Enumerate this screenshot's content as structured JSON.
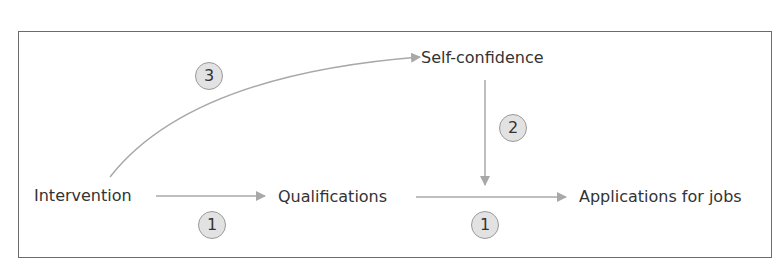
{
  "diagram": {
    "nodes": {
      "intervention": "Intervention",
      "qualifications": "Qualifications",
      "self_confidence": "Self-confidence",
      "applications": "Applications for jobs"
    },
    "badges": {
      "intervention_to_qualifications": "1",
      "qualifications_to_applications": "1",
      "self_confidence_to_link": "2",
      "intervention_to_self_confidence": "3"
    },
    "edges": [
      {
        "from": "Intervention",
        "to": "Qualifications",
        "label": "1"
      },
      {
        "from": "Qualifications",
        "to": "Applications for jobs",
        "label": "1"
      },
      {
        "from": "Self-confidence",
        "to": "Qualifications → Applications for jobs",
        "label": "2"
      },
      {
        "from": "Intervention",
        "to": "Self-confidence",
        "label": "3"
      }
    ],
    "colors": {
      "arrow": "#a8a8a8",
      "badge_fill": "#e2e2e2",
      "text": "#333333",
      "frame": "#6b6b6b"
    }
  }
}
